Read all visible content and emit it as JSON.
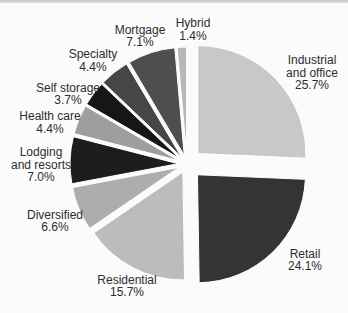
{
  "page": {
    "background": "#fbfbfb",
    "top_rule_color": "#cfcfcf"
  },
  "chart_data": {
    "type": "pie",
    "title": "",
    "legend": "none",
    "direction": "clockwise",
    "start_angle_deg": 0,
    "center": {
      "x": 187,
      "y": 164
    },
    "radius": 108,
    "label_color": "#2d2d2d",
    "gap_color": "#ffffff",
    "slices": [
      {
        "label": "Industrial and office",
        "value": 25.7,
        "color": "#c8c8c8",
        "explode": 15
      },
      {
        "label": "Retail",
        "value": 24.1,
        "color": "#343434",
        "explode": 15
      },
      {
        "label": "Residential",
        "value": 15.7,
        "color": "#bcbcbc",
        "explode": 9
      },
      {
        "label": "Diversified",
        "value": 6.6,
        "color": "#adadad",
        "explode": 9
      },
      {
        "label": "Lodging and resorts",
        "value": 7.0,
        "color": "#1d1d1d",
        "explode": 9
      },
      {
        "label": "Health care",
        "value": 4.4,
        "color": "#9e9e9e",
        "explode": 9
      },
      {
        "label": "Self storage",
        "value": 3.7,
        "color": "#161616",
        "explode": 9
      },
      {
        "label": "Specialty",
        "value": 4.4,
        "color": "#464646",
        "explode": 9
      },
      {
        "label": "Mortgage",
        "value": 7.1,
        "color": "#4e4e4e",
        "explode": 9
      },
      {
        "label": "Hybrid",
        "value": 1.4,
        "color": "#b7b7b7",
        "explode": 9
      }
    ],
    "labels": [
      {
        "slice": "Industrial and office",
        "x": 312,
        "y": 64,
        "lines": [
          "Industrial",
          "and office",
          "25.7%"
        ]
      },
      {
        "slice": "Retail",
        "x": 305,
        "y": 257.5,
        "lines": [
          "Retail",
          "24.1%"
        ]
      },
      {
        "slice": "Residential",
        "x": 127,
        "y": 283.5,
        "lines": [
          "Residential",
          "15.7%"
        ]
      },
      {
        "slice": "Diversified",
        "x": 55,
        "y": 218.5,
        "lines": [
          "Diversified",
          "6.6%"
        ]
      },
      {
        "slice": "Lodging and resorts",
        "x": 41,
        "y": 156,
        "lines": [
          "Lodging",
          "and resorts",
          "7.0%"
        ]
      },
      {
        "slice": "Health care",
        "x": 50,
        "y": 120,
        "lines": [
          "Health care",
          "4.4%"
        ]
      },
      {
        "slice": "Self storage",
        "x": 68,
        "y": 91.5,
        "lines": [
          "Self storage",
          "3.7%"
        ]
      },
      {
        "slice": "Specialty",
        "x": 93,
        "y": 58,
        "lines": [
          "Specialty",
          "4.4%"
        ]
      },
      {
        "slice": "Mortgage",
        "x": 140,
        "y": 33.5,
        "lines": [
          "Mortgage",
          "7.1%"
        ]
      },
      {
        "slice": "Hybrid",
        "x": 193,
        "y": 27,
        "lines": [
          "Hybrid",
          "1.4%"
        ]
      }
    ]
  }
}
